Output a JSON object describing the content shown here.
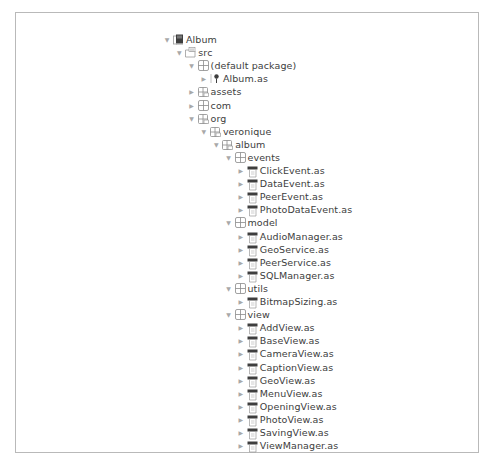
{
  "tree": {
    "row_height": 13.1,
    "top": 20,
    "nodes": [
      {
        "label": "Album",
        "depth": 0,
        "expanded": true,
        "type": "project"
      },
      {
        "label": "src",
        "depth": 1,
        "expanded": true,
        "type": "source-folder"
      },
      {
        "label": "(default package)",
        "depth": 2,
        "expanded": true,
        "type": "package"
      },
      {
        "label": "Album.as",
        "depth": 3,
        "expanded": false,
        "type": "main-file"
      },
      {
        "label": "assets",
        "depth": 2,
        "expanded": false,
        "type": "package-folder"
      },
      {
        "label": "com",
        "depth": 2,
        "expanded": false,
        "type": "package"
      },
      {
        "label": "org",
        "depth": 2,
        "expanded": true,
        "type": "package-folder"
      },
      {
        "label": "veronique",
        "depth": 3,
        "expanded": true,
        "type": "package-folder"
      },
      {
        "label": "album",
        "depth": 4,
        "expanded": true,
        "type": "package-folder"
      },
      {
        "label": "events",
        "depth": 5,
        "expanded": true,
        "type": "package"
      },
      {
        "label": "ClickEvent.as",
        "depth": 6,
        "expanded": false,
        "type": "file"
      },
      {
        "label": "DataEvent.as",
        "depth": 6,
        "expanded": false,
        "type": "file"
      },
      {
        "label": "PeerEvent.as",
        "depth": 6,
        "expanded": false,
        "type": "file"
      },
      {
        "label": "PhotoDataEvent.as",
        "depth": 6,
        "expanded": false,
        "type": "file"
      },
      {
        "label": "model",
        "depth": 5,
        "expanded": true,
        "type": "package"
      },
      {
        "label": "AudioManager.as",
        "depth": 6,
        "expanded": false,
        "type": "file"
      },
      {
        "label": "GeoService.as",
        "depth": 6,
        "expanded": false,
        "type": "file"
      },
      {
        "label": "PeerService.as",
        "depth": 6,
        "expanded": false,
        "type": "file"
      },
      {
        "label": "SQLManager.as",
        "depth": 6,
        "expanded": false,
        "type": "file"
      },
      {
        "label": "utils",
        "depth": 5,
        "expanded": true,
        "type": "package"
      },
      {
        "label": "BitmapSizing.as",
        "depth": 6,
        "expanded": false,
        "type": "file"
      },
      {
        "label": "view",
        "depth": 5,
        "expanded": true,
        "type": "package"
      },
      {
        "label": "AddView.as",
        "depth": 6,
        "expanded": false,
        "type": "file"
      },
      {
        "label": "BaseView.as",
        "depth": 6,
        "expanded": false,
        "type": "file"
      },
      {
        "label": "CameraView.as",
        "depth": 6,
        "expanded": false,
        "type": "file"
      },
      {
        "label": "CaptionView.as",
        "depth": 6,
        "expanded": false,
        "type": "file"
      },
      {
        "label": "GeoView.as",
        "depth": 6,
        "expanded": false,
        "type": "file"
      },
      {
        "label": "MenuView.as",
        "depth": 6,
        "expanded": false,
        "type": "file"
      },
      {
        "label": "OpeningView.as",
        "depth": 6,
        "expanded": false,
        "type": "file"
      },
      {
        "label": "PhotoView.as",
        "depth": 6,
        "expanded": false,
        "type": "file"
      },
      {
        "label": "SavingView.as",
        "depth": 6,
        "expanded": false,
        "type": "file"
      },
      {
        "label": "ViewManager.as",
        "depth": 6,
        "expanded": false,
        "type": "file"
      }
    ]
  },
  "icons": {
    "expanded": "▼",
    "collapsed": "▶"
  },
  "colors": {
    "border": "#b9b9b9",
    "text": "#3d3d3d",
    "arrow": "#a8a8a8",
    "icon_dark": "#4a4a4a",
    "icon_light": "#9a9a9a"
  }
}
